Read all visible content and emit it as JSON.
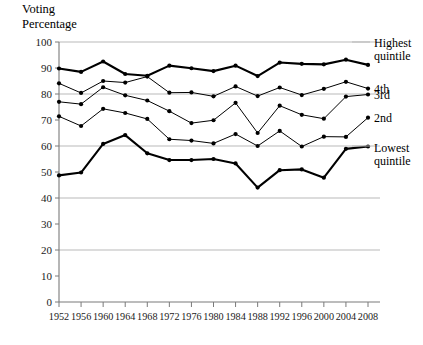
{
  "chart_data": {
    "type": "line",
    "title": "Voting\nPercentage",
    "xlabel": "",
    "ylabel": "Voting Percentage",
    "ylim": [
      0,
      100
    ],
    "ytick_values": [
      0,
      10,
      20,
      30,
      40,
      50,
      60,
      70,
      80,
      90,
      100
    ],
    "ytick_labels": [
      "0",
      "10",
      "20",
      "30",
      "40",
      "50",
      "60",
      "70",
      "80",
      "90",
      "100"
    ],
    "grid": "horizontal gridlines at 20, 40, 60, 80, 100",
    "legend_position": "right of plot, at end of each line",
    "categories": [
      1952,
      1956,
      1960,
      1964,
      1968,
      1972,
      1976,
      1980,
      1984,
      1988,
      1992,
      1996,
      2000,
      2004,
      2008
    ],
    "xtick_labels": [
      "1952",
      "1956",
      "1960",
      "1964",
      "1968",
      "1972",
      "1976",
      "1980",
      "1984",
      "1988",
      "1992",
      "1996",
      "2000",
      "2004",
      "2008"
    ],
    "series": [
      {
        "name": "Highest quintile",
        "label": "Highest\nquintile",
        "emphasis": "thick",
        "values": [
          89.8,
          88.5,
          92.5,
          87.7,
          87.0,
          90.9,
          89.9,
          88.8,
          90.9,
          86.9,
          92.1,
          91.6,
          91.4,
          93.2,
          91.2
        ]
      },
      {
        "name": "4th",
        "label": "4th",
        "emphasis": "thin",
        "values": [
          84.1,
          80.4,
          85.0,
          84.4,
          86.7,
          80.5,
          80.6,
          79.1,
          82.9,
          79.2,
          82.5,
          79.6,
          82.0,
          84.7,
          82.1
        ]
      },
      {
        "name": "3rd",
        "label": "3rd",
        "emphasis": "thin",
        "values": [
          77.0,
          76.1,
          82.6,
          79.5,
          77.5,
          73.4,
          68.8,
          69.9,
          76.6,
          65.0,
          75.5,
          72.0,
          70.5,
          79.0,
          79.8
        ]
      },
      {
        "name": "2nd",
        "label": "2nd",
        "emphasis": "thin",
        "values": [
          71.4,
          67.7,
          74.3,
          72.7,
          70.4,
          62.6,
          62.1,
          61.0,
          64.6,
          60.0,
          65.8,
          59.8,
          63.6,
          63.5,
          70.9
        ]
      },
      {
        "name": "Lowest quintile",
        "label": "Lowest\nquintile",
        "emphasis": "thick",
        "values": [
          48.7,
          49.8,
          60.8,
          64.2,
          57.2,
          54.6,
          54.6,
          55.0,
          53.3,
          44.0,
          50.7,
          51.0,
          47.8,
          58.9,
          59.8
        ]
      }
    ]
  },
  "axes": {
    "plot_left_x": 1952,
    "plot_right_x": 2008,
    "y_axis_title_line1": "Voting",
    "y_axis_title_line2": "Percentage"
  }
}
